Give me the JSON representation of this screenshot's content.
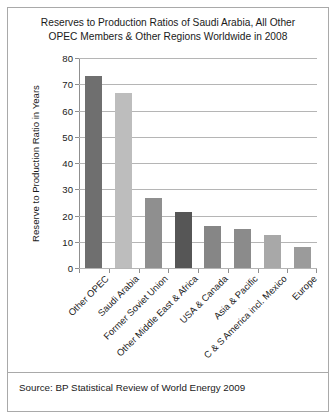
{
  "figure": {
    "title_line1": "Reserves to Production Ratios of Saudi Arabia, All Other",
    "title_line2": "OPEC Members & Other Regions Worldwide in 2008",
    "source_note": "Source: BP Statistical Review of World Energy 2009"
  },
  "chart_data": {
    "type": "bar",
    "title": "Reserves to Production Ratios of Saudi Arabia, All Other OPEC Members & Other Regions Worldwide in 2008",
    "xlabel": "",
    "ylabel": "Reserve to Production Ratio in Years",
    "ylim": [
      0,
      80
    ],
    "ytick_values": [
      0,
      10,
      20,
      30,
      40,
      50,
      60,
      70,
      80
    ],
    "ytick_labels": [
      "0",
      "10",
      "20",
      "30",
      "40",
      "50",
      "60",
      "70",
      "80"
    ],
    "grid": true,
    "legend": "none",
    "categories": [
      "Other OPEC",
      "Saudi Arabia",
      "Former Soviet Union",
      "Other Middle East & Africa",
      "USA & Canada",
      "Asia & Pacific",
      "C & S America incl. Mexico",
      "Europe"
    ],
    "values": [
      73,
      66.5,
      26.5,
      21.5,
      16,
      15,
      12.5,
      8
    ],
    "bar_colors": [
      "#6f6f6f",
      "#bdbdbd",
      "#8f8f8f",
      "#565656",
      "#868686",
      "#8b8b8b",
      "#a8a8a8",
      "#9b9b9b"
    ]
  }
}
